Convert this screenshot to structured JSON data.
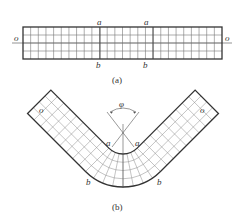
{
  "figure_a": {
    "caption": "(a)",
    "labels": {
      "o_left": "o",
      "o_right": "o",
      "a_left": "a",
      "a_right": "a",
      "b_left": "b",
      "b_right": "b"
    },
    "grid": {
      "rows": 4,
      "columns": 26
    }
  },
  "figure_b": {
    "caption": "(b)",
    "angle_label": "φ",
    "labels": {
      "o_left": "o",
      "o_right": "o",
      "a_left": "a",
      "a_right": "a",
      "b_left": "b",
      "b_right": "b"
    }
  },
  "colors": {
    "outline": "#333333",
    "grid": "#777777",
    "background": "#ffffff"
  }
}
